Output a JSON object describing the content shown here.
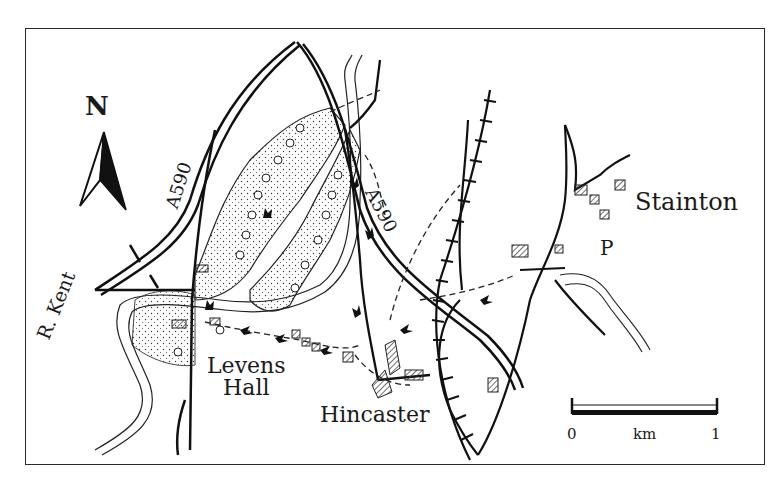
{
  "map": {
    "north_label": "N",
    "places": {
      "levens_hall": [
        "Levens",
        "Hall"
      ],
      "hincaster": "Hincaster",
      "stainton": "Stainton"
    },
    "roads": {
      "a590_west": "A590",
      "a590_east": "A590"
    },
    "river": "R. Kent",
    "parking": "P",
    "scale": {
      "start": "0",
      "unit": "km",
      "end": "1"
    },
    "colors": {
      "ink": "#1a1a1a",
      "paper": "#ffffff",
      "hatch": "#555555"
    }
  }
}
